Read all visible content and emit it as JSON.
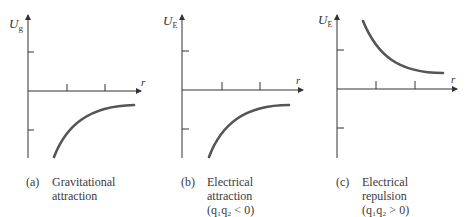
{
  "figure": {
    "panels": [
      {
        "id": "a",
        "y_axis_label": "U",
        "y_axis_subscript": "g",
        "x_axis_label": "r",
        "caption_tag": "(a)",
        "caption_lines": [
          "Gravitational",
          "attraction"
        ],
        "curve": "negative, approaching zero from below as r increases"
      },
      {
        "id": "b",
        "y_axis_label": "U",
        "y_axis_subscript": "E",
        "x_axis_label": "r",
        "caption_tag": "(b)",
        "caption_lines": [
          "Electrical",
          "attraction",
          "(q₁q₂ < 0)"
        ],
        "curve": "negative, approaching zero from below as r increases"
      },
      {
        "id": "c",
        "y_axis_label": "U",
        "y_axis_subscript": "E",
        "x_axis_label": "r",
        "caption_tag": "(c)",
        "caption_lines": [
          "Electrical",
          "repulsion",
          "(q₁q₂ > 0)"
        ],
        "curve": "positive, decreasing toward zero from above as r increases"
      }
    ],
    "colors": {
      "axis": "#333333",
      "curve": "#555555",
      "text": "#3a3a3a"
    }
  }
}
